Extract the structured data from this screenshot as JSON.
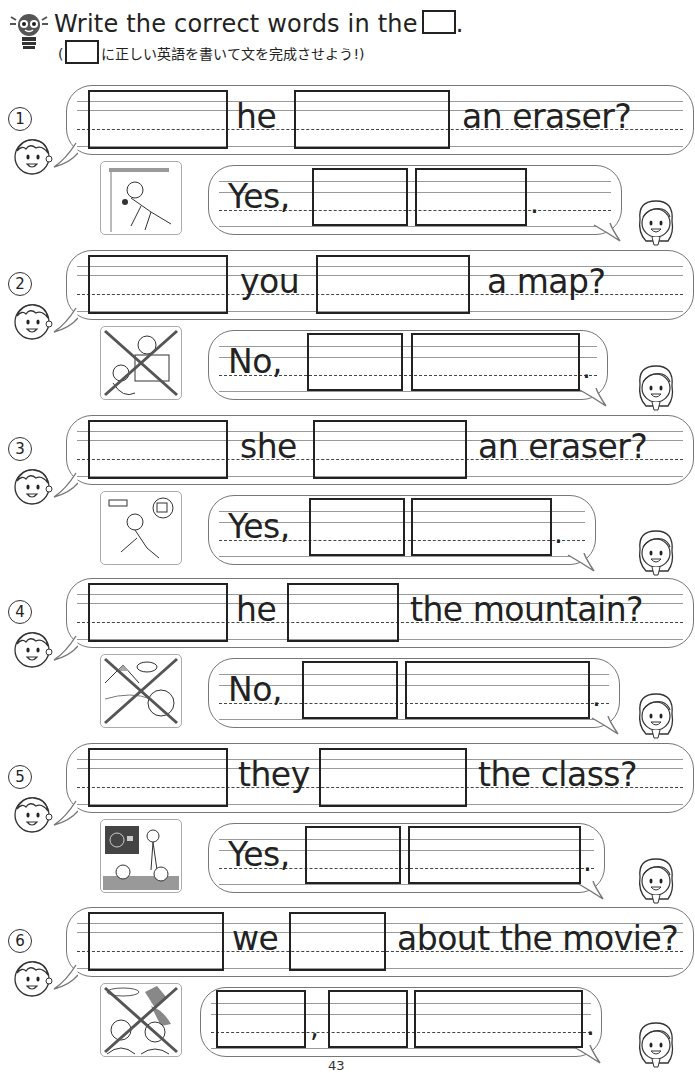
{
  "header": {
    "title": "Write the correct words in the",
    "title_end": ".",
    "subtitle_open": "(",
    "subtitle_text": "に正しい英語を書いて文を完成させよう!)",
    "ruby": [
      "ただ",
      "えいご",
      "か",
      "ぶん",
      "かんせい"
    ]
  },
  "exercises": [
    {
      "num": "1",
      "question": {
        "words": [
          "he",
          "an eraser?"
        ]
      },
      "answer": {
        "lead": "Yes,",
        "end": "."
      },
      "picture": "boy-under-desk-with-eraser",
      "crossed": false
    },
    {
      "num": "2",
      "question": {
        "words": [
          "you",
          "a map?"
        ]
      },
      "answer": {
        "lead": "No,",
        "end": "."
      },
      "picture": "kids-holding-map",
      "crossed": true
    },
    {
      "num": "3",
      "question": {
        "words": [
          "she",
          "an eraser?"
        ]
      },
      "answer": {
        "lead": "Yes,",
        "end": "."
      },
      "picture": "girl-looking-under-table",
      "crossed": false
    },
    {
      "num": "4",
      "question": {
        "words": [
          "he",
          "the mountain?"
        ]
      },
      "answer": {
        "lead": "No,",
        "end": "."
      },
      "picture": "boy-and-mountain",
      "crossed": true
    },
    {
      "num": "5",
      "question": {
        "words": [
          "they",
          "the class?"
        ]
      },
      "answer": {
        "lead": "Yes,",
        "end": "."
      },
      "picture": "classroom-scene",
      "crossed": false
    },
    {
      "num": "6",
      "question": {
        "words": [
          "we",
          "about the movie?"
        ]
      },
      "answer": {
        "lead": "",
        "mid": ",",
        "end": "."
      },
      "picture": "kids-at-movie",
      "crossed": true
    }
  ],
  "footer": {
    "page_number": "43"
  },
  "colors": {
    "ink": "#222222",
    "bubble_border": "#777777",
    "guide_line": "#999999"
  }
}
